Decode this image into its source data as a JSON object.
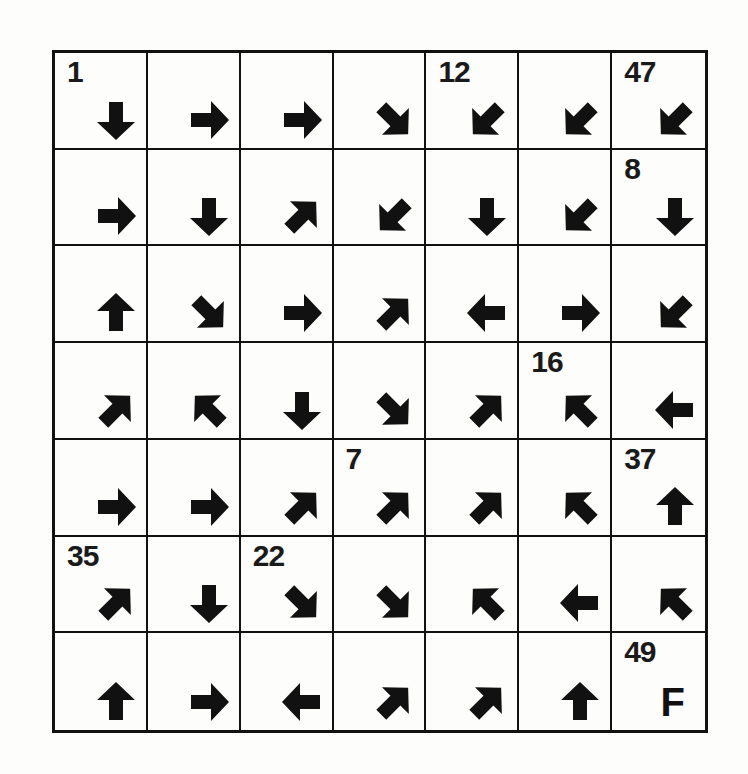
{
  "puzzle": {
    "type": "arrow-path-puzzle",
    "rows": 7,
    "cols": 7,
    "finish_label": "F",
    "cells": [
      [
        {
          "number": "1",
          "arrow": "S"
        },
        {
          "number": "",
          "arrow": "E"
        },
        {
          "number": "",
          "arrow": "E"
        },
        {
          "number": "",
          "arrow": "SE"
        },
        {
          "number": "12",
          "arrow": "SW"
        },
        {
          "number": "",
          "arrow": "SW"
        },
        {
          "number": "47",
          "arrow": "SW"
        }
      ],
      [
        {
          "number": "",
          "arrow": "E"
        },
        {
          "number": "",
          "arrow": "S"
        },
        {
          "number": "",
          "arrow": "NE"
        },
        {
          "number": "",
          "arrow": "SW"
        },
        {
          "number": "",
          "arrow": "S"
        },
        {
          "number": "",
          "arrow": "SW"
        },
        {
          "number": "8",
          "arrow": "S"
        }
      ],
      [
        {
          "number": "",
          "arrow": "N"
        },
        {
          "number": "",
          "arrow": "SE"
        },
        {
          "number": "",
          "arrow": "E"
        },
        {
          "number": "",
          "arrow": "NE"
        },
        {
          "number": "",
          "arrow": "W"
        },
        {
          "number": "",
          "arrow": "E"
        },
        {
          "number": "",
          "arrow": "SW"
        }
      ],
      [
        {
          "number": "",
          "arrow": "NE"
        },
        {
          "number": "",
          "arrow": "NW"
        },
        {
          "number": "",
          "arrow": "S"
        },
        {
          "number": "",
          "arrow": "SE"
        },
        {
          "number": "",
          "arrow": "NE"
        },
        {
          "number": "16",
          "arrow": "NW"
        },
        {
          "number": "",
          "arrow": "W"
        }
      ],
      [
        {
          "number": "",
          "arrow": "E"
        },
        {
          "number": "",
          "arrow": "E"
        },
        {
          "number": "",
          "arrow": "NE"
        },
        {
          "number": "7",
          "arrow": "NE"
        },
        {
          "number": "",
          "arrow": "NE"
        },
        {
          "number": "",
          "arrow": "NW"
        },
        {
          "number": "37",
          "arrow": "N"
        }
      ],
      [
        {
          "number": "35",
          "arrow": "NE"
        },
        {
          "number": "",
          "arrow": "S"
        },
        {
          "number": "22",
          "arrow": "SE"
        },
        {
          "number": "",
          "arrow": "SE"
        },
        {
          "number": "",
          "arrow": "NW"
        },
        {
          "number": "",
          "arrow": "W"
        },
        {
          "number": "",
          "arrow": "NW"
        }
      ],
      [
        {
          "number": "",
          "arrow": "N"
        },
        {
          "number": "",
          "arrow": "E"
        },
        {
          "number": "",
          "arrow": "W"
        },
        {
          "number": "",
          "arrow": "NE"
        },
        {
          "number": "",
          "arrow": "NE"
        },
        {
          "number": "",
          "arrow": "N"
        },
        {
          "number": "49",
          "arrow": "F"
        }
      ]
    ]
  }
}
